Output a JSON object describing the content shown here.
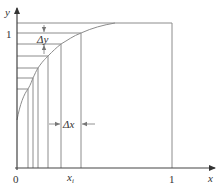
{
  "diagram": {
    "y_axis_label": "y",
    "x_axis_label": "x",
    "y_tick_one": "1",
    "x_tick_one": "1",
    "origin_label": "0",
    "xi_label_main": "x",
    "xi_label_sub": "i",
    "delta_y_label": "Δy",
    "delta_x_label": "Δx",
    "colors": {
      "line": "#8c8c8c",
      "axis": "#444444",
      "text": "#333333"
    }
  }
}
